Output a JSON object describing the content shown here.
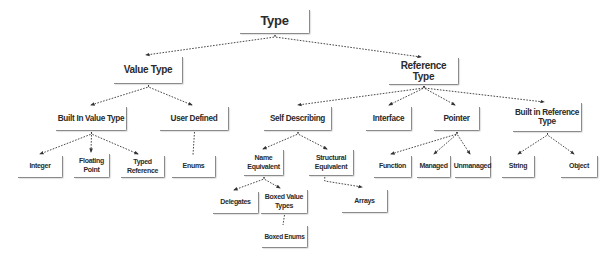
{
  "diagram": {
    "title": "Type",
    "line_color": "#333333",
    "box_border_color": "#8a8a8a",
    "text_color": "#2b2b2b",
    "nodes": [
      {
        "id": "type",
        "label": "Type",
        "x": 240,
        "y": 10,
        "w": 70,
        "h": 24,
        "lvl": 0
      },
      {
        "id": "value_type",
        "label": "Value Type",
        "x": 114,
        "y": 57,
        "w": 69,
        "h": 27,
        "lvl": 1
      },
      {
        "id": "reference_type",
        "label": "Reference Type",
        "x": 389,
        "y": 58,
        "w": 70,
        "h": 27,
        "lvl": 1
      },
      {
        "id": "built_in_value_type",
        "label": "Built In Value Type",
        "x": 56,
        "y": 107,
        "w": 71,
        "h": 24,
        "lvl": 2
      },
      {
        "id": "user_defined",
        "label": "User Defined",
        "x": 160,
        "y": 107,
        "w": 69,
        "h": 24,
        "lvl": 2
      },
      {
        "id": "self_describing",
        "label": "Self Describing",
        "x": 264,
        "y": 107,
        "w": 68,
        "h": 24,
        "lvl": 2
      },
      {
        "id": "interface",
        "label": "Interface",
        "x": 366,
        "y": 107,
        "w": 46,
        "h": 24,
        "lvl": 2
      },
      {
        "id": "pointer",
        "label": "Pointer",
        "x": 434,
        "y": 107,
        "w": 46,
        "h": 24,
        "lvl": 2
      },
      {
        "id": "built_in_reference_type",
        "label": "Built in Reference Type",
        "x": 513,
        "y": 103,
        "w": 69,
        "h": 29,
        "lvl": 2
      },
      {
        "id": "integer",
        "label": "Integer",
        "x": 18,
        "y": 156,
        "w": 45,
        "h": 22,
        "lvl": 3
      },
      {
        "id": "floating_point",
        "label": "Floating Point",
        "x": 74,
        "y": 154,
        "w": 36,
        "h": 24,
        "lvl": 3
      },
      {
        "id": "typed_reference",
        "label": "Typed Reference",
        "x": 121,
        "y": 156,
        "w": 44,
        "h": 22,
        "lvl": 3
      },
      {
        "id": "enums",
        "label": "Enums",
        "x": 172,
        "y": 156,
        "w": 44,
        "h": 22,
        "lvl": 3
      },
      {
        "id": "name_equivalent",
        "label": "Name Equivalent",
        "x": 244,
        "y": 150,
        "w": 40,
        "h": 26,
        "lvl": 3
      },
      {
        "id": "structural_equivalent",
        "label": "Structural Equivalent",
        "x": 309,
        "y": 150,
        "w": 45,
        "h": 26,
        "lvl": 3
      },
      {
        "id": "function",
        "label": "Function",
        "x": 374,
        "y": 156,
        "w": 38,
        "h": 22,
        "lvl": 3
      },
      {
        "id": "managed",
        "label": "Managed",
        "x": 417,
        "y": 156,
        "w": 34,
        "h": 22,
        "lvl": 3
      },
      {
        "id": "unmanaged",
        "label": "Unmanaged",
        "x": 455,
        "y": 156,
        "w": 36,
        "h": 22,
        "lvl": 3
      },
      {
        "id": "string",
        "label": "String",
        "x": 502,
        "y": 156,
        "w": 33,
        "h": 22,
        "lvl": 3
      },
      {
        "id": "object",
        "label": "Object",
        "x": 561,
        "y": 156,
        "w": 37,
        "h": 22,
        "lvl": 3
      },
      {
        "id": "delegates",
        "label": "Delegates",
        "x": 213,
        "y": 192,
        "w": 46,
        "h": 22,
        "lvl": 3
      },
      {
        "id": "boxed_value_types",
        "label": "Boxed Value Types",
        "x": 261,
        "y": 190,
        "w": 47,
        "h": 24,
        "lvl": 3
      },
      {
        "id": "arrays",
        "label": "Arrays",
        "x": 342,
        "y": 190,
        "w": 46,
        "h": 23,
        "lvl": 3
      },
      {
        "id": "boxed_enums",
        "label": "Boxed Enums",
        "x": 262,
        "y": 226,
        "w": 46,
        "h": 22,
        "lvl": 4
      }
    ],
    "edges": [
      {
        "from": "type",
        "to": "value_type",
        "style": "arrow",
        "tx": 146,
        "ty": 55
      },
      {
        "from": "type",
        "to": "reference_type",
        "style": "arrow",
        "tx": 421,
        "ty": 57
      },
      {
        "from": "value_type",
        "to": "built_in_value_type",
        "style": "arrow",
        "tx": 91,
        "ty": 105
      },
      {
        "from": "value_type",
        "to": "user_defined",
        "style": "arrow",
        "tx": 192,
        "ty": 105
      },
      {
        "from": "reference_type",
        "to": "self_describing",
        "style": "arrow",
        "tx": 298,
        "ty": 105
      },
      {
        "from": "reference_type",
        "to": "interface",
        "style": "arrow",
        "tx": 389,
        "ty": 105
      },
      {
        "from": "reference_type",
        "to": "pointer",
        "style": "arrow",
        "tx": 455,
        "ty": 105
      },
      {
        "from": "reference_type",
        "to": "built_in_reference_type",
        "style": "arrow",
        "tx": 544,
        "ty": 102
      },
      {
        "from": "built_in_value_type",
        "to": "integer",
        "style": "arrow",
        "tx": 40,
        "ty": 154
      },
      {
        "from": "built_in_value_type",
        "to": "floating_point",
        "style": "arrow",
        "tx": 91,
        "ty": 152
      },
      {
        "from": "built_in_value_type",
        "to": "typed_reference",
        "style": "arrow",
        "tx": 138,
        "ty": 154
      },
      {
        "from": "user_defined",
        "to": "enums",
        "style": "plain",
        "tx": 193,
        "ty": 155
      },
      {
        "from": "self_describing",
        "to": "name_equivalent",
        "style": "arrow",
        "tx": 263,
        "ty": 149
      },
      {
        "from": "self_describing",
        "to": "structural_equivalent",
        "style": "arrow",
        "tx": 327,
        "ty": 149
      },
      {
        "from": "pointer",
        "to": "function",
        "style": "arrow",
        "tx": 391,
        "ty": 154
      },
      {
        "from": "pointer",
        "to": "managed",
        "style": "arrow",
        "tx": 434,
        "ty": 154
      },
      {
        "from": "pointer",
        "to": "unmanaged",
        "style": "arrow",
        "tx": 470,
        "ty": 154
      },
      {
        "from": "built_in_reference_type",
        "to": "string",
        "style": "arrow",
        "tx": 518,
        "ty": 154
      },
      {
        "from": "built_in_reference_type",
        "to": "object",
        "style": "arrow",
        "tx": 574,
        "ty": 154
      },
      {
        "from": "name_equivalent",
        "to": "delegates",
        "style": "arrow",
        "tx": 234,
        "ty": 190
      },
      {
        "from": "name_equivalent",
        "to": "boxed_value_types",
        "style": "arrow",
        "tx": 280,
        "ty": 188
      },
      {
        "from": "structural_equivalent",
        "to": "arrays",
        "style": "arrow-elbow",
        "tx": 362,
        "ty": 187
      },
      {
        "from": "boxed_value_types",
        "to": "boxed_enums",
        "style": "plain",
        "tx": 283,
        "ty": 225
      }
    ]
  }
}
